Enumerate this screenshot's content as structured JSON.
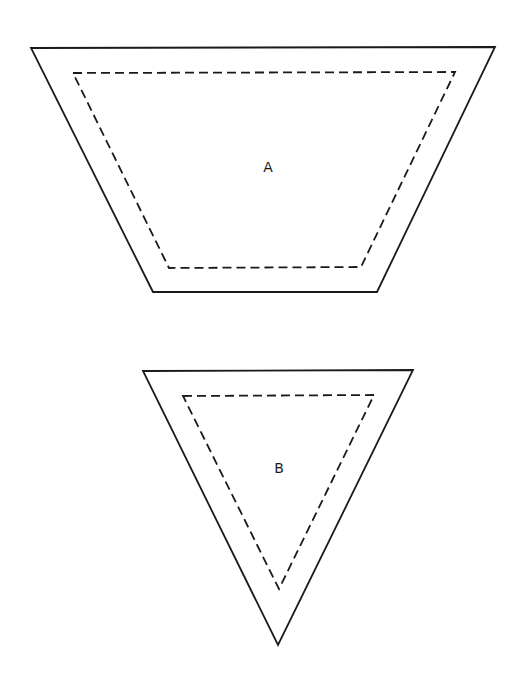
{
  "diagram": {
    "title": "",
    "style": {
      "stroke_color": "#1a1a1a",
      "background": "#ffffff"
    },
    "pieces": [
      {
        "id": "A",
        "label": "A",
        "shape": "trapezoid",
        "label_pos": [
          268,
          172
        ],
        "outer_points": "31,48 495,47 377,292 153,292",
        "seam_points": "73,73 455,72 361,267 169,268"
      },
      {
        "id": "B",
        "label": "B",
        "shape": "inverted-triangle",
        "label_pos": [
          279,
          473
        ],
        "outer_points": "143,371 413,370 278,645",
        "seam_points": "183,396 374,395 279,589"
      }
    ]
  }
}
